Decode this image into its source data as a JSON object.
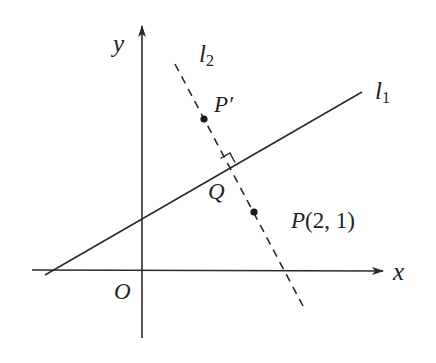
{
  "diagram": {
    "type": "coordinate-geometry",
    "axes": {
      "x_label": "x",
      "y_label": "y",
      "origin_label": "O",
      "color": "#2a2a2a"
    },
    "lines": [
      {
        "id": "l1",
        "name": "l",
        "subscript": "1",
        "style": "solid"
      },
      {
        "id": "l2",
        "name": "l",
        "subscript": "2",
        "style": "dashed"
      }
    ],
    "points": {
      "P_prime": {
        "label": "P′"
      },
      "P": {
        "label_letter": "P",
        "label_coords": "(2, 1)"
      },
      "Q": {
        "label": "Q"
      }
    },
    "right_angle_marker": "at Q between l1 and l2"
  }
}
